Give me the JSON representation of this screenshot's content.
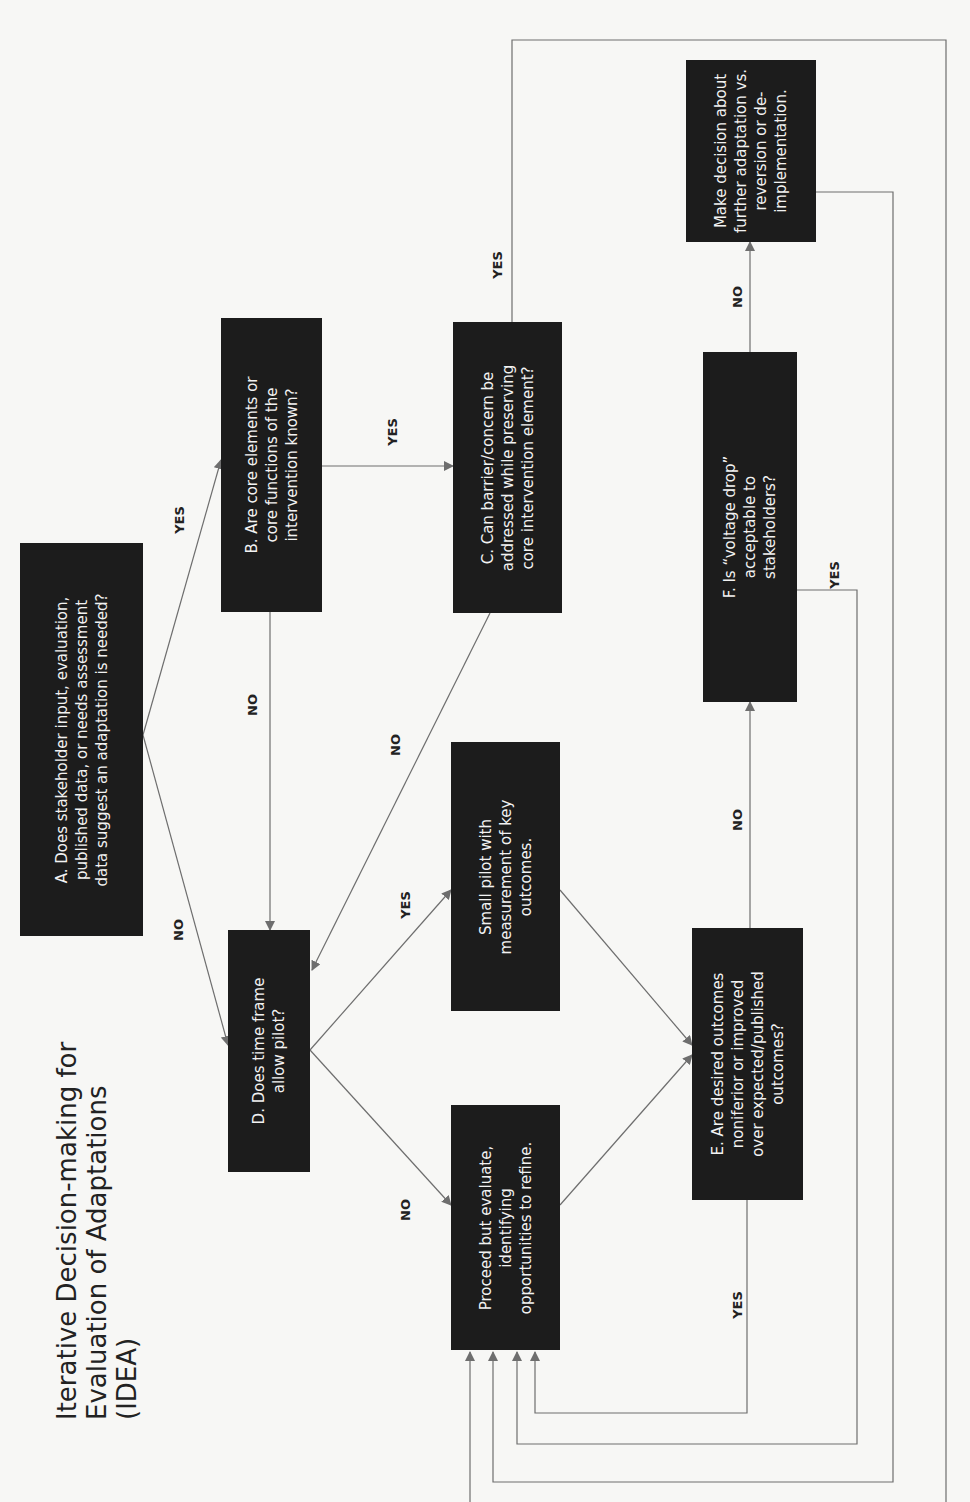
{
  "title": "Iterative Decision-making for\nEvaluation of Adaptations\n(IDEA)",
  "nodes": {
    "A": "A. Does stakeholder input, evaluation,\npublished data, or needs assessment\ndata suggest an adaptation is needed?",
    "B": "B. Are core elements or\ncore functions of the\nintervention known?",
    "C": "C. Can barrier/concern be\naddressed while preserving\ncore intervention element?",
    "D": "D. Does time frame\nallow pilot?",
    "pilot": "Small pilot with\nmeasurement of key\noutcomes.",
    "proceed": "Proceed but evaluate,\nidentifying\nopportunities to refine.",
    "E": "E. Are desired outcomes\nnoniferior or improved\nover expected/published\noutcomes?",
    "F": "F. Is “voltage drop”\nacceptable to\nstakeholders?",
    "decision": "Make decision about\nfurther adaptation vs.\nreversion or de-\nimplementation."
  },
  "edge_labels": {
    "A_B": "YES",
    "A_D": "NO",
    "B_C": "YES",
    "B_D": "NO",
    "C_D": "NO",
    "C_loop": "YES",
    "D_pilot": "YES",
    "D_proceed": "NO",
    "E_F": "NO",
    "E_loop": "YES",
    "F_decision": "NO",
    "F_loop": "YES"
  },
  "colors": {
    "box_fill": "#1c1c1c",
    "box_text": "#f2f2f2",
    "line": "#6e6e6e",
    "background": "#f7f7f5"
  }
}
